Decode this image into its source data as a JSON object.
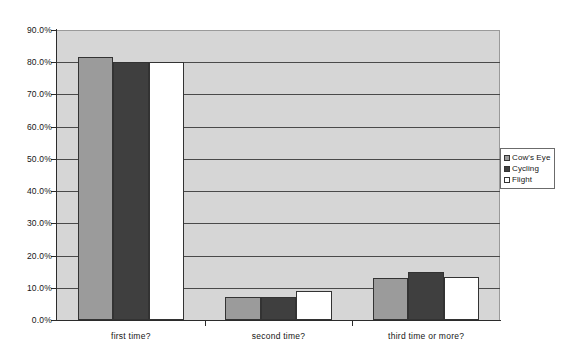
{
  "chart_data": {
    "type": "bar",
    "title": "",
    "subtitle": "",
    "xlabel": "",
    "ylabel": "",
    "categories": [
      "first time?",
      "second time?",
      "third time or more?"
    ],
    "series": [
      {
        "name": "Cow's Eye",
        "color": "#9b9b9b",
        "values": [
          81.5,
          7.0,
          13.0
        ]
      },
      {
        "name": "Cycling",
        "color": "#3f3f3f",
        "values": [
          80.0,
          7.0,
          15.0
        ]
      },
      {
        "name": "Flight",
        "color": "#ffffff",
        "values": [
          80.0,
          9.0,
          13.5
        ]
      }
    ],
    "ylim": [
      0,
      90
    ],
    "ytick_values": [
      0,
      10,
      20,
      30,
      40,
      50,
      60,
      70,
      80,
      90
    ],
    "ytick_labels": [
      "0.0%",
      "10.0%",
      "20.0%",
      "30.0%",
      "40.0%",
      "50.0%",
      "60.0%",
      "70.0%",
      "80.0%",
      "90.0%"
    ],
    "grid": true,
    "grid_axis": "y",
    "legend_position": "right-middle",
    "plot_background": "#d6d6d6",
    "figure_background": "#ffffff",
    "gridline_color": "#4a4a4a",
    "axis_color": "#2b2b2b"
  },
  "legend": {
    "entries": [
      {
        "label": "Cow's Eye",
        "swatch": "#9b9b9b"
      },
      {
        "label": "Cycling",
        "swatch": "#3f3f3f"
      },
      {
        "label": "Flight",
        "swatch": "#ffffff"
      }
    ]
  }
}
